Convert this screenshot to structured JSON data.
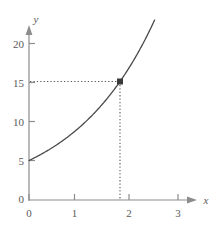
{
  "chart_data": {
    "type": "line",
    "title": "",
    "subtitle": "",
    "xlabel": "x",
    "ylabel": "y",
    "xlim": [
      0,
      3.1
    ],
    "ylim": [
      0,
      22
    ],
    "xticks": [
      "0",
      "1",
      "2",
      "3"
    ],
    "xtick_values": [
      0,
      1,
      2,
      3
    ],
    "yticks": [
      "0",
      "5",
      "10",
      "15",
      "20"
    ],
    "ytick_values": [
      0,
      5,
      10,
      15,
      20
    ],
    "grid": false,
    "legend": null,
    "series": [
      {
        "name": "exponential-curve",
        "kind": "exponential",
        "initial_value": 5,
        "growth_base": 1.7320508,
        "x": [
          0,
          0.25,
          0.5,
          0.75,
          1,
          1.25,
          1.5,
          1.75,
          2,
          2.25,
          2.5,
          2.75,
          3
        ],
        "values": [
          5,
          5.7,
          6.58,
          7.6,
          8.66,
          10.0,
          11.4,
          13.2,
          15,
          17.3,
          19.9,
          22.9,
          26.0
        ],
        "x_visible_end": 2.76,
        "color": "#4a4a4a"
      }
    ],
    "annotations": [
      {
        "name": "marked-point",
        "x": 2,
        "y": 15,
        "marker": "square",
        "color": "#3a3a3a",
        "guide_horizontal": true,
        "guide_vertical": true,
        "guide_style": "dotted"
      }
    ],
    "axis_arrows": {
      "x": true,
      "y": true
    },
    "origin_labels": {
      "y_zero": "0",
      "x_zero": "0"
    },
    "colors": {
      "axis": "#8c8c8c",
      "curve": "#4a4a4a",
      "guide": "#5a5a5a",
      "text": "#5a5a5a",
      "background": "#ffffff"
    }
  }
}
